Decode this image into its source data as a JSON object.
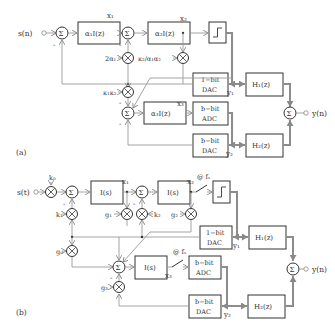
{
  "diagram_a": {
    "label": "(a)",
    "input": "s(n)",
    "output": "y(n)",
    "sum": "Σ",
    "blocks": {
      "int1": "α₁I(z)",
      "int2": "α₂I(z)",
      "int3": "α₃I(z)",
      "dac1": [
        "1−bit",
        "DAC"
      ],
      "adc_b": [
        "b−bit",
        "ADC"
      ],
      "dac_b": [
        "b−bit",
        "DAC"
      ],
      "h1": "H₁(z)",
      "h2": "H₂(z)"
    },
    "gains": {
      "g_2a1": "2α₁",
      "g_k2": "κ₂/α₁α₂",
      "g_k1k2": "κ₁κ₂"
    },
    "signals": {
      "x1": "x₁",
      "x2": "x₂",
      "x3": "x₃",
      "y1": "y₁",
      "y2": "y₂"
    },
    "minus": "-"
  },
  "diagram_b": {
    "label": "(b)",
    "input": "s(t)",
    "output": "y(n)",
    "sum": "Σ",
    "blocks": {
      "int1": "I(s)",
      "int2": "I(s)",
      "int3": "I(s)",
      "dac1": [
        "1−bit",
        "DAC"
      ],
      "adc_b": [
        "b−bit",
        "ADC"
      ],
      "dac_b": [
        "b−bit",
        "DAC"
      ],
      "h1": "H₁(z)",
      "h2": "H₂(z)"
    },
    "gains": {
      "k0": "k₀",
      "k1": "k₁",
      "k2": "k₂",
      "g0": "g₀",
      "g1": "g₁",
      "g2": "g₂",
      "g3": "g₃"
    },
    "signals": {
      "x1": "x₁",
      "x2": "x₂",
      "x3": "x₃",
      "y1": "y₁",
      "y2": "y₂"
    },
    "sample1": "@ fₛ",
    "sample2": "@ fₛ",
    "minus": "-"
  }
}
